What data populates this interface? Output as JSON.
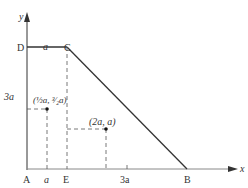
{
  "diagram": {
    "axes": {
      "x_label": "x",
      "y_label": "y"
    },
    "points": {
      "A": "A",
      "B": "B",
      "C": "C",
      "D": "D",
      "E": "E"
    },
    "dimensions": {
      "dc": "a",
      "ad": "3a",
      "ae_tick": "a",
      "eb": "3a"
    },
    "marked_points": [
      {
        "label": "(½a, ³⁄₂a)"
      },
      {
        "label": "(2a, a)"
      }
    ],
    "colors": {
      "line": "#333333",
      "dashed": "#555555"
    }
  }
}
